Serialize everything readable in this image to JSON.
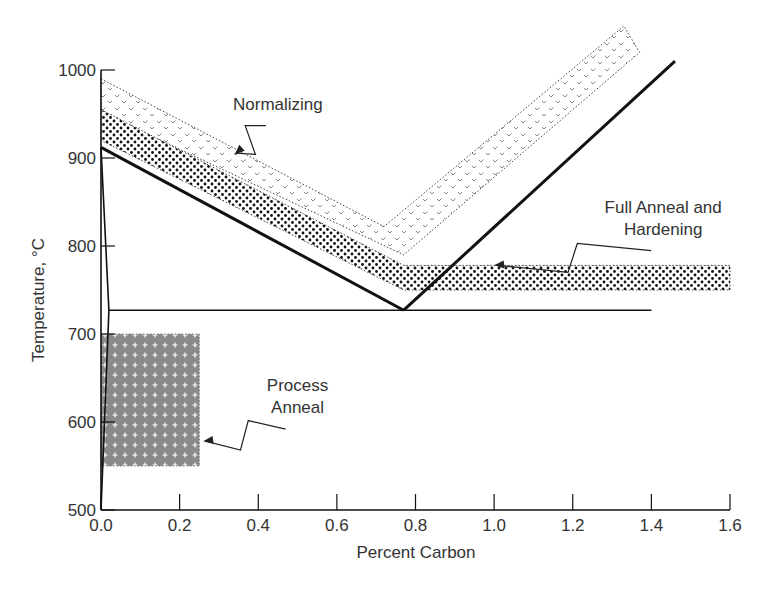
{
  "chart_data": {
    "type": "area",
    "title": "",
    "xlabel": "Percent Carbon",
    "ylabel": "Temperature, °C",
    "xlim": [
      0.0,
      1.6
    ],
    "ylim": [
      500,
      1000
    ],
    "grid": false,
    "x_ticks": [
      "0.0",
      "0.2",
      "0.4",
      "0.6",
      "0.8",
      "1.0",
      "1.2",
      "1.4",
      "1.6"
    ],
    "x_tick_values": [
      0.0,
      0.2,
      0.4,
      0.6,
      0.8,
      1.0,
      1.2,
      1.4,
      1.6
    ],
    "y_ticks": [
      "500",
      "600",
      "700",
      "800",
      "900",
      "1000"
    ],
    "y_tick_values": [
      500,
      600,
      700,
      800,
      900,
      1000
    ],
    "lines": [
      {
        "name": "A3",
        "style": "heavy",
        "points": [
          [
            0.0,
            912
          ],
          [
            0.77,
            727
          ]
        ]
      },
      {
        "name": "Acm",
        "style": "heavy",
        "points": [
          [
            0.77,
            727
          ],
          [
            1.46,
            1010
          ]
        ]
      },
      {
        "name": "A1",
        "style": "thin",
        "points": [
          [
            0.02,
            727
          ],
          [
            1.4,
            727
          ]
        ]
      },
      {
        "name": "Ferrite solvus",
        "style": "thin",
        "points": [
          [
            0.0,
            912
          ],
          [
            0.02,
            727
          ],
          [
            0.0,
            500
          ]
        ]
      }
    ],
    "regions": [
      {
        "name": "Normalizing",
        "pattern": "checks",
        "polygon": [
          [
            0.0,
            990
          ],
          [
            0.72,
            822
          ],
          [
            1.33,
            1050
          ],
          [
            1.37,
            1020
          ],
          [
            0.77,
            790
          ],
          [
            0.0,
            952
          ]
        ]
      },
      {
        "name": "Full Anneal and Hardening",
        "pattern": "dots",
        "polygon": [
          [
            0.0,
            955
          ],
          [
            0.77,
            778
          ],
          [
            1.6,
            778
          ],
          [
            1.6,
            750
          ],
          [
            0.77,
            750
          ],
          [
            0.0,
            920
          ]
        ]
      },
      {
        "name": "Process Anneal",
        "pattern": "crosses-gray",
        "polygon": [
          [
            0.0,
            700
          ],
          [
            0.25,
            700
          ],
          [
            0.25,
            550
          ],
          [
            0.0,
            550
          ]
        ]
      }
    ],
    "annotations": [
      {
        "text": [
          "Normalizing"
        ],
        "points_to": [
          0.34,
          904
        ],
        "text_at": [
          0.45,
          955
        ]
      },
      {
        "text": [
          "Full Anneal and",
          "Hardening"
        ],
        "points_to": [
          1.0,
          778
        ],
        "text_at": [
          1.43,
          838
        ]
      },
      {
        "text": [
          "Process",
          "Anneal"
        ],
        "points_to": [
          0.26,
          578
        ],
        "text_at": [
          0.5,
          635
        ]
      }
    ]
  }
}
